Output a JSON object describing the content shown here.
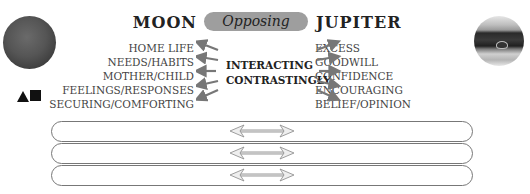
{
  "diagram": {
    "relation_label": "Opposing",
    "center_label_lines": [
      "INTERACTING",
      "CONTRASTINGLY"
    ],
    "left_planet": {
      "name": "MOON",
      "icon": "moon-icon",
      "keywords": [
        "HOME LIFE",
        "NEEDS/HABITS",
        "MOTHER/CHILD",
        "FEELINGS/RESPONSES",
        "SECURING/COMFORTING"
      ]
    },
    "right_planet": {
      "name": "JUPITER",
      "icon": "jupiter-icon",
      "keywords": [
        "EXCESS",
        "GOODWILL",
        "CONFIDENCE",
        "ENCOURAGING",
        "BELIEF/OPINION"
      ]
    },
    "element_symbols": [
      "triangle-icon",
      "square-icon"
    ],
    "bands": [
      {
        "arrow": "double-arrow-icon"
      },
      {
        "arrow": "double-arrow-icon"
      },
      {
        "arrow": "double-arrow-icon"
      }
    ]
  }
}
